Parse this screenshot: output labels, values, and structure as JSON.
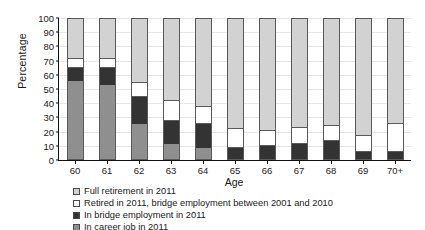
{
  "chart_data": {
    "type": "bar",
    "subtype": "stacked-100-percent",
    "title": "",
    "xlabel": "Age",
    "ylabel": "Percentage",
    "ylim": [
      0,
      100
    ],
    "yticks": [
      0,
      10,
      20,
      30,
      40,
      50,
      60,
      70,
      80,
      90,
      100
    ],
    "grid": true,
    "legend_position": "below",
    "categories": [
      "60",
      "61",
      "62",
      "63",
      "64",
      "65",
      "66",
      "67",
      "68",
      "69",
      "70+"
    ],
    "series": [
      {
        "name": "Full retirement in 2011",
        "color": "#d2d2d2",
        "values": [
          28,
          28,
          45,
          58,
          62,
          78,
          79,
          77,
          76,
          83,
          74
        ]
      },
      {
        "name": "Retired in 2011, bridge employment between 2001 and 2010",
        "color": "#ffffff",
        "values": [
          7,
          7,
          11,
          15,
          13,
          14,
          12,
          12,
          11,
          12,
          21
        ]
      },
      {
        "name": "In bridge employment in 2011",
        "color": "#333333",
        "values": [
          9,
          12,
          19,
          16,
          17,
          8,
          9,
          11,
          13,
          5,
          5
        ]
      },
      {
        "name": "In career job in 2011",
        "color": "#8f8f8f",
        "values": [
          56,
          53,
          25,
          11,
          8,
          0,
          0,
          0,
          0,
          0,
          0
        ]
      }
    ]
  }
}
